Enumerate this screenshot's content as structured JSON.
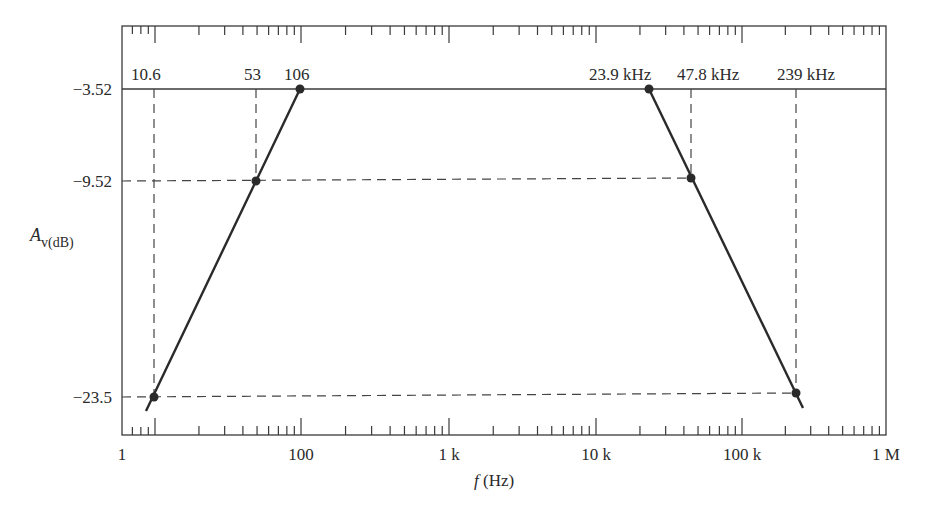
{
  "chart_data": {
    "type": "line",
    "title": "",
    "xlabel": "f (Hz)",
    "ylabel": "A_v(dB)",
    "xscale": "log",
    "xlim": [
      1,
      1000000
    ],
    "x_tick_labels": [
      "1",
      "100",
      "1 k",
      "10 k",
      "100 k",
      "1 M"
    ],
    "y_tick_labels": [
      "-3.52",
      "-9.52",
      "-23.5"
    ],
    "y_ticks": [
      -3.52,
      -9.52,
      -23.5
    ],
    "grid": false,
    "legend": null,
    "series": [
      {
        "name": "low-frequency asymptote",
        "x": [
          10.6,
          53,
          106
        ],
        "y": [
          -23.5,
          -9.52,
          -3.52
        ]
      },
      {
        "name": "mid-band",
        "x": [
          106,
          23900
        ],
        "y": [
          -3.52,
          -3.52
        ]
      },
      {
        "name": "high-frequency asymptote",
        "x": [
          23900,
          47800,
          239000
        ],
        "y": [
          -3.52,
          -9.52,
          -23.5
        ]
      }
    ],
    "annotations": [
      "10.6",
      "53",
      "106",
      "23.9 kHz",
      "47.8 kHz",
      "239 kHz"
    ]
  },
  "labels": {
    "top_points": [
      {
        "text": "10.6",
        "x": 131,
        "y": 80
      },
      {
        "text": "53",
        "x": 244,
        "y": 80
      },
      {
        "text": "106",
        "x": 284,
        "y": 80
      },
      {
        "text": "23.9 kHz",
        "x": 589,
        "y": 80
      },
      {
        "text": "47.8 kHz",
        "x": 677,
        "y": 80
      },
      {
        "text": "239 kHz",
        "x": 777,
        "y": 80
      }
    ],
    "y_ticks": [
      {
        "text": "−3.52",
        "y": 95
      },
      {
        "text": "−9.52",
        "y": 187
      },
      {
        "text": "−23.5",
        "y": 403
      }
    ],
    "x_ticks": [
      {
        "text": "1",
        "x": 122
      },
      {
        "text": "100",
        "x": 301
      },
      {
        "text": "1 k",
        "x": 449
      },
      {
        "text": "10 k",
        "x": 596
      },
      {
        "text": "100 k",
        "x": 742
      },
      {
        "text": "1 M",
        "x": 886
      }
    ],
    "y_axis_title_main": "A",
    "y_axis_title_sub": "v(dB)",
    "x_axis_title_f": "f",
    "x_axis_title_unit": " (Hz)"
  },
  "geometry": {
    "frame": {
      "x1": 122,
      "y1": 26,
      "x2": 886,
      "y2": 435
    },
    "decades": [
      155,
      301,
      449,
      596,
      742,
      886
    ],
    "points": [
      {
        "x": 154,
        "y": 397
      },
      {
        "x": 256,
        "y": 181
      },
      {
        "x": 300,
        "y": 89
      },
      {
        "x": 649,
        "y": 89
      },
      {
        "x": 691,
        "y": 178
      },
      {
        "x": 796,
        "y": 393
      }
    ]
  }
}
